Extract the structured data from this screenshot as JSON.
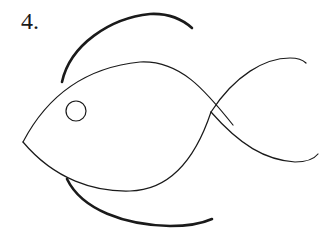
{
  "figure": {
    "label": "4.",
    "stroke_color": "#1a1a1a",
    "background": "#ffffff",
    "parts": {
      "body_top": "M23,142 C45,100 80,68 140,62 C180,60 205,90 233,125",
      "body_bottom": "M23,142 C55,180 95,192 130,191 C170,190 195,160 211,112",
      "tail_upper": "M211,112 C235,75 265,58 290,58 C298,58 303,60 306,63",
      "tail_lower": "M211,112 C240,145 265,160 295,162 C307,162 314,159 318,154",
      "fin_top": "M62,82 C70,45 110,18 150,14 C170,13 183,20 192,28",
      "fin_bottom": "M67,179 C82,210 125,225 170,226 C190,226 203,223 212,219",
      "eye": {
        "cx": 76,
        "cy": 111,
        "r": 10
      }
    }
  }
}
